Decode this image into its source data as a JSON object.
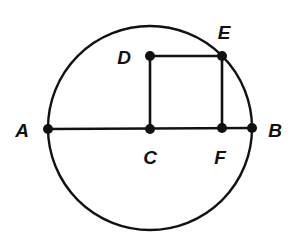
{
  "diagram": {
    "stroke_color": "#111111",
    "background": "#ffffff",
    "circle": {
      "cx": 150,
      "cy": 128,
      "r": 102
    },
    "points": {
      "A": {
        "label": "A",
        "x": 48,
        "y": 129,
        "label_x": 22,
        "label_y": 137
      },
      "B": {
        "label": "B",
        "x": 252,
        "y": 128,
        "label_x": 275,
        "label_y": 137
      },
      "C": {
        "label": "C",
        "x": 150,
        "y": 129,
        "label_x": 150,
        "label_y": 164
      },
      "D": {
        "label": "D",
        "x": 150,
        "y": 56,
        "label_x": 124,
        "label_y": 64
      },
      "E": {
        "label": "E",
        "x": 222,
        "y": 56,
        "label_x": 224,
        "label_y": 39
      },
      "F": {
        "label": "F",
        "x": 222,
        "y": 128,
        "label_x": 220,
        "label_y": 164
      }
    },
    "segments": [
      [
        "A",
        "B"
      ],
      [
        "C",
        "D"
      ],
      [
        "D",
        "E"
      ],
      [
        "E",
        "F"
      ]
    ]
  }
}
